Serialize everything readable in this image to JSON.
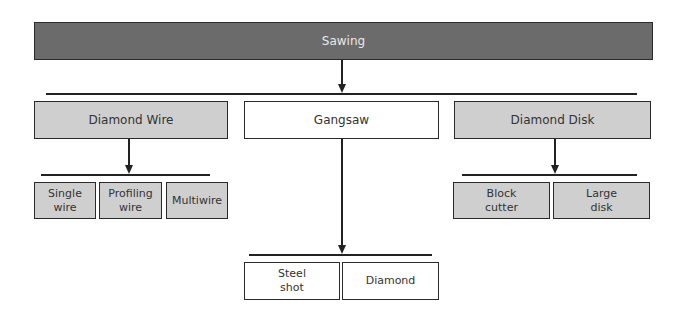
{
  "diagram": {
    "root": {
      "label": "Sawing"
    },
    "methods": [
      {
        "label": "Diamond Wire",
        "children": [
          {
            "label": "Single\nwire"
          },
          {
            "label": "Profiling\nwire"
          },
          {
            "label": "Multiwire"
          }
        ]
      },
      {
        "label": "Gangsaw",
        "children": [
          {
            "label": "Steel\nshot"
          },
          {
            "label": "Diamond"
          }
        ]
      },
      {
        "label": "Diamond Disk",
        "children": [
          {
            "label": "Block\ncutter"
          },
          {
            "label": "Large\ndisk"
          }
        ]
      }
    ]
  },
  "colors": {
    "root_fill": "#6b6b6b",
    "grey_fill": "#cfcfcf",
    "white_fill": "#ffffff",
    "line": "#222222"
  }
}
